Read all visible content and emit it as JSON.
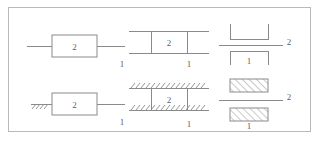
{
  "figure": {
    "border_color": "#b9b9b9",
    "line_color": "#8a8a8a",
    "background": "#ffffff",
    "label_color": "#5f5f5f"
  },
  "diagrams": [
    {
      "id": "free-floating-block",
      "row": "top",
      "column": "left",
      "style": "block",
      "grounded": false,
      "body_label": "2",
      "link_label": "1"
    },
    {
      "id": "free-floating-slider-rails",
      "row": "top",
      "column": "middle",
      "style": "rails",
      "grounded": false,
      "body_label": "2",
      "link_label": "1"
    },
    {
      "id": "free-floating-bracket-pair",
      "row": "top",
      "column": "right",
      "style": "brackets",
      "grounded": false,
      "body_label": "1",
      "link_label": "2"
    },
    {
      "id": "grounded-block",
      "row": "bottom",
      "column": "left",
      "style": "block",
      "grounded": true,
      "body_label": "2",
      "link_label": "1"
    },
    {
      "id": "grounded-slider-rails",
      "row": "bottom",
      "column": "middle",
      "style": "rails",
      "grounded": true,
      "body_label": "2",
      "link_label": "1"
    },
    {
      "id": "grounded-hatched-blocks",
      "row": "bottom",
      "column": "right",
      "style": "hatched-blocks",
      "grounded": true,
      "body_label": "1",
      "link_label": "2"
    }
  ],
  "labels": {
    "tl_body": "2",
    "tl_link": "1",
    "tm_body": "2",
    "tm_link": "1",
    "tr_line": "2",
    "tr_link": "1",
    "bl_body": "2",
    "bl_link": "1",
    "bm_body": "2",
    "bm_link": "1",
    "br_line": "2",
    "br_link": "1"
  }
}
